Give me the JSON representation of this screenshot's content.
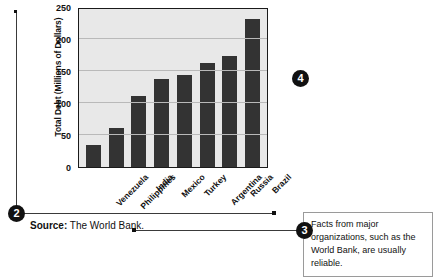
{
  "markers": {
    "source_marker": "2",
    "annotation_marker": "3",
    "chart_marker": "4"
  },
  "source": {
    "label": "Source:",
    "value": " The World Bank."
  },
  "annotation": {
    "text": "Facts from major organizations, such as the World Bank, are usually reliable."
  },
  "chart_data": {
    "type": "bar",
    "title": "",
    "xlabel": "",
    "ylabel": "Total Debt (Millions of Dollars)",
    "categories": [
      "Venezuela",
      "Philippines",
      "India",
      "Mexico",
      "Turkey",
      "Argentina",
      "Russia",
      "Brazil"
    ],
    "values": [
      35,
      62,
      113,
      140,
      146,
      166,
      176,
      235
    ],
    "ylim": [
      0,
      250
    ],
    "yticks": [
      0,
      50,
      100,
      150,
      200,
      250
    ],
    "grid": true,
    "legend": "none",
    "bar_color": "#333333",
    "plot_background": "#e8e8e8",
    "axis_color": "#1a1a1a",
    "gridline_color": "#b9b9b9"
  }
}
